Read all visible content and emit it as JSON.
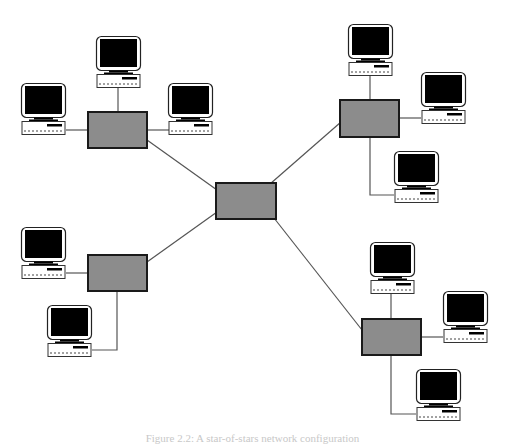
{
  "diagram": {
    "colors": {
      "background": "#ffffff",
      "hub_fill": "#8c8c8c",
      "hub_stroke": "#1a1a1a",
      "link": "#555555",
      "screen": "#000000"
    },
    "hubs": [
      {
        "id": "central",
        "x": 216,
        "y": 183,
        "w": 60,
        "h": 36
      },
      {
        "id": "top-left",
        "x": 88,
        "y": 112,
        "w": 59,
        "h": 36
      },
      {
        "id": "top-right",
        "x": 340,
        "y": 100,
        "w": 59,
        "h": 37
      },
      {
        "id": "bottom-left",
        "x": 88,
        "y": 255,
        "w": 59,
        "h": 36
      },
      {
        "id": "bottom-right",
        "x": 362,
        "y": 319,
        "w": 59,
        "h": 36
      }
    ],
    "computers": [
      {
        "id": "tl-top",
        "hub": "top-left",
        "x": 96,
        "y": 36
      },
      {
        "id": "tl-left",
        "hub": "top-left",
        "x": 21,
        "y": 83
      },
      {
        "id": "tl-right",
        "hub": "top-left",
        "x": 168,
        "y": 83
      },
      {
        "id": "tr-top",
        "hub": "top-right",
        "x": 348,
        "y": 24
      },
      {
        "id": "tr-right",
        "hub": "top-right",
        "x": 421,
        "y": 72
      },
      {
        "id": "tr-bottom",
        "hub": "top-right",
        "x": 394,
        "y": 151
      },
      {
        "id": "bl-left",
        "hub": "bottom-left",
        "x": 21,
        "y": 227
      },
      {
        "id": "bl-bottom",
        "hub": "bottom-left",
        "x": 47,
        "y": 305
      },
      {
        "id": "br-top",
        "hub": "bottom-right",
        "x": 370,
        "y": 242
      },
      {
        "id": "br-right",
        "hub": "bottom-right",
        "x": 443,
        "y": 291
      },
      {
        "id": "br-bottom",
        "hub": "bottom-right",
        "x": 416,
        "y": 369
      }
    ]
  },
  "caption": "Figure 2.2: A star-of-stars network configuration"
}
